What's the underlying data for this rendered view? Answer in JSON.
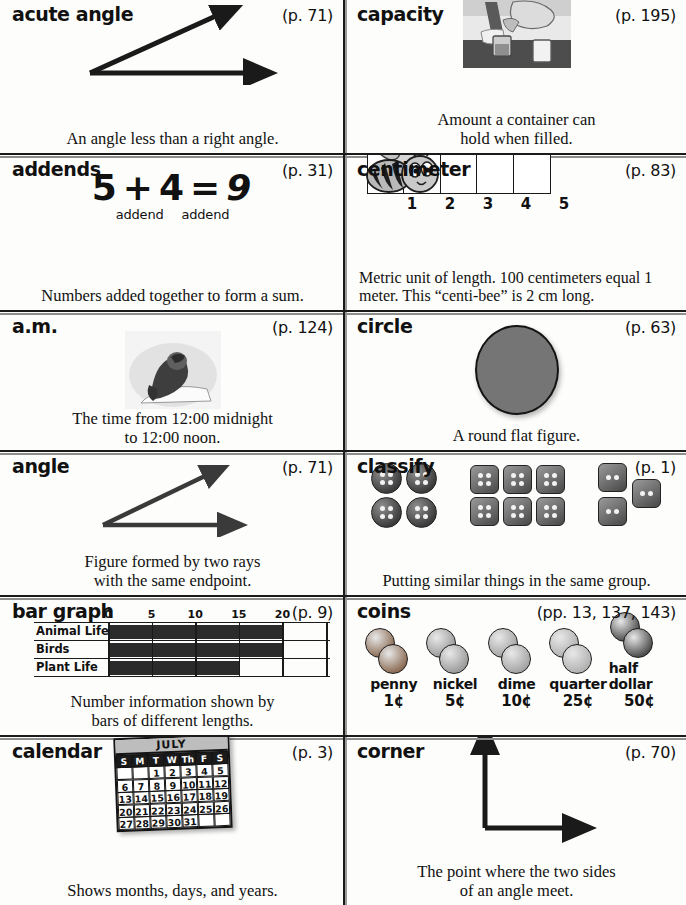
{
  "entries": [
    {
      "term": "acute angle",
      "page_ref": "(p. 71)",
      "definition": "An angle less than a right angle.",
      "art": "acute-angle-diagram"
    },
    {
      "term": "capacity",
      "page_ref": "(p. 195)",
      "definition": "Amount a container can\nhold when filled.",
      "art": "pouring-liquid-photo"
    },
    {
      "term": "addends",
      "page_ref": "(p. 31)",
      "definition": "Numbers added together to form a sum.",
      "equation": {
        "a": "5",
        "op": "+",
        "b": "4",
        "eq": "=",
        "sum": "9",
        "label_a": "addend",
        "label_b": "addend"
      }
    },
    {
      "term": "centimeter",
      "page_ref": "(p. 83)",
      "definition": "Metric unit of length. 100 centimeters equal 1 meter. This “centi-bee” is 2 cm long.",
      "ruler_marks": [
        "1",
        "2",
        "3",
        "4",
        "5"
      ],
      "art": "centi-bee-ruler"
    },
    {
      "term": "a.m.",
      "page_ref": "(p. 124)",
      "definition": "The time from 12:00 midnight\nto 12:00 noon.",
      "art": "sleeping-child-photo"
    },
    {
      "term": "circle",
      "page_ref": "(p. 63)",
      "definition": "A round flat figure.",
      "art": "gray-circle"
    },
    {
      "term": "angle",
      "page_ref": "(p. 71)",
      "definition": "Figure formed by two rays\nwith the same endpoint.",
      "art": "angle-diagram"
    },
    {
      "term": "classify",
      "page_ref": "(p. 1)",
      "definition": "Putting similar things in the same group.",
      "art": "button-groups",
      "groups": [
        {
          "shape": "round",
          "holes": 4,
          "count": 4
        },
        {
          "shape": "square",
          "holes": 4,
          "count": 6
        },
        {
          "shape": "square",
          "holes": 2,
          "count": 3
        }
      ]
    },
    {
      "term": "bar graph",
      "page_ref": "(p. 9)",
      "definition": "Number information shown by\nbars of different lengths.",
      "art": "bar-graph-diagram"
    },
    {
      "term": "coins",
      "page_ref": "(pp. 13, 137, 143)",
      "definition": "",
      "art": "coin-photos",
      "coins": [
        {
          "name": "penny",
          "value": "1¢",
          "color": "#8a6a52"
        },
        {
          "name": "nickel",
          "value": "5¢",
          "color": "#9a9a9a"
        },
        {
          "name": "dime",
          "value": "10¢",
          "color": "#a3a3a3"
        },
        {
          "name": "quarter",
          "value": "25¢",
          "color": "#b0b0b0"
        },
        {
          "name": "half dollar",
          "value": "50¢",
          "color": "#4a4a4a"
        }
      ]
    },
    {
      "term": "calendar",
      "page_ref": "(p. 3)",
      "definition": "Shows months, days, and years.",
      "art": "july-calendar",
      "calendar": {
        "month": "JULY",
        "dow": [
          "S",
          "M",
          "T",
          "W",
          "Th",
          "F",
          "S"
        ],
        "weeks": [
          [
            "",
            "",
            "1",
            "2",
            "3",
            "4",
            "5"
          ],
          [
            "6",
            "7",
            "8",
            "9",
            "10",
            "11",
            "12"
          ],
          [
            "13",
            "14",
            "15",
            "16",
            "17",
            "18",
            "19"
          ],
          [
            "20",
            "21",
            "22",
            "23",
            "24",
            "25",
            "26"
          ],
          [
            "27",
            "28",
            "29",
            "30",
            "31",
            "",
            ""
          ]
        ]
      }
    },
    {
      "term": "corner",
      "page_ref": "(p. 70)",
      "definition": "The point where the two sides\nof an angle meet.",
      "art": "corner-diagram"
    }
  ],
  "chart_data": {
    "type": "bar",
    "title": "bar graph",
    "orientation": "horizontal",
    "categories": [
      "Animal Life",
      "Birds",
      "Plant Life"
    ],
    "values": [
      20,
      20,
      15
    ],
    "xlabel": "",
    "ylabel": "",
    "xlim": [
      0,
      25
    ],
    "ticks": [
      "0",
      "5",
      "10",
      "15",
      "20"
    ],
    "tick_values": [
      0,
      5,
      10,
      15,
      20
    ],
    "grid": true,
    "legend": "none"
  }
}
